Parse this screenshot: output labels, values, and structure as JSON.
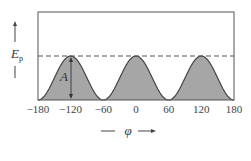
{
  "chart_data": {
    "type": "area",
    "title": "",
    "xlabel": "φ",
    "ylabel": "E_p",
    "ylabel_main": "E",
    "ylabel_sub": "p",
    "annotation": "A",
    "xlim": [
      -180,
      180
    ],
    "xticks": [
      "-180",
      "-120",
      "-60",
      "0",
      "60",
      "120",
      "180"
    ],
    "tick_labels": [
      "−180",
      "−120",
      "−60",
      "0",
      "60",
      "120",
      "180"
    ],
    "x": [
      -180,
      -150,
      -120,
      -90,
      -60,
      -30,
      0,
      30,
      60,
      90,
      120,
      150,
      180
    ],
    "values_relative_to_A": [
      1,
      0.5,
      0,
      0.5,
      1,
      0.5,
      0,
      0.5,
      1,
      0.5,
      0,
      0.5,
      1
    ],
    "function": "E_p = (A/2)(1 + cos 3φ)",
    "dashed_line": "maximum energy level A",
    "grid": false,
    "legend": null,
    "fill_color": "#a6a6a6",
    "line_color": "#444444"
  }
}
